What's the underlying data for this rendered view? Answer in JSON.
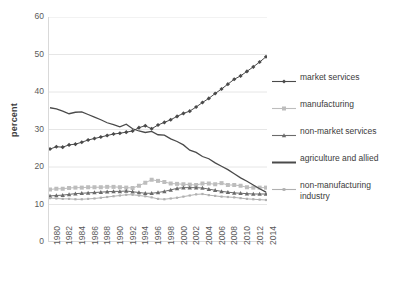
{
  "chart_data": {
    "type": "line",
    "title": "",
    "xlabel": "",
    "ylabel": "percent",
    "ylim": [
      0,
      60
    ],
    "yticks": [
      0,
      10,
      20,
      30,
      40,
      50,
      60
    ],
    "grid": true,
    "legend_position": "right",
    "x": [
      1980,
      1981,
      1982,
      1983,
      1984,
      1985,
      1986,
      1987,
      1988,
      1989,
      1990,
      1991,
      1992,
      1993,
      1994,
      1995,
      1996,
      1997,
      1998,
      1999,
      2000,
      2001,
      2002,
      2003,
      2004,
      2005,
      2006,
      2007,
      2008,
      2009,
      2010,
      2011,
      2012,
      2013,
      2014
    ],
    "xtick_labels": [
      "1980",
      "1982",
      "1984",
      "1986",
      "1988",
      "1990",
      "1992",
      "1994",
      "1996",
      "1998",
      "2000",
      "2002",
      "2004",
      "2006",
      "2008",
      "2010",
      "2012",
      "2014"
    ],
    "series": [
      {
        "name": "market services",
        "marker": "diamond",
        "color": "#4a4a4a",
        "values": [
          24.8,
          25.4,
          25.3,
          25.9,
          26.1,
          26.6,
          27.2,
          27.6,
          28.0,
          28.4,
          28.8,
          29.0,
          29.3,
          29.6,
          30.5,
          31.0,
          30.2,
          31.2,
          31.9,
          32.6,
          33.5,
          34.3,
          34.9,
          36.0,
          37.2,
          38.3,
          39.6,
          40.8,
          42.1,
          43.4,
          44.3,
          45.5,
          46.7,
          48.0,
          49.4
        ]
      },
      {
        "name": "manufacturing",
        "marker": "square",
        "color": "#bdbdbd",
        "values": [
          14.0,
          14.2,
          14.2,
          14.4,
          14.5,
          14.5,
          14.6,
          14.6,
          14.6,
          14.7,
          14.7,
          14.6,
          14.5,
          14.4,
          15.0,
          15.8,
          16.6,
          16.3,
          16.0,
          15.6,
          15.5,
          15.4,
          15.3,
          15.2,
          15.6,
          15.6,
          15.4,
          15.7,
          15.2,
          15.2,
          15.0,
          14.6,
          14.5,
          14.5,
          14.5
        ]
      },
      {
        "name": "non-market services",
        "marker": "triangle",
        "color": "#6b6b6b",
        "values": [
          12.3,
          12.4,
          12.5,
          12.7,
          12.9,
          13.0,
          13.1,
          13.2,
          13.3,
          13.4,
          13.5,
          13.5,
          13.6,
          13.4,
          13.2,
          13.0,
          13.0,
          13.2,
          13.5,
          13.9,
          14.3,
          14.5,
          14.5,
          14.5,
          14.4,
          14.1,
          13.8,
          13.5,
          13.3,
          13.1,
          13.0,
          12.9,
          12.8,
          12.8,
          12.8
        ]
      },
      {
        "name": "agriculture and allied",
        "marker": "none",
        "color": "#4a4a4a",
        "values": [
          35.8,
          35.5,
          34.9,
          34.2,
          34.6,
          34.7,
          34.0,
          33.3,
          32.6,
          31.8,
          31.3,
          30.7,
          31.4,
          30.2,
          29.6,
          29.2,
          29.5,
          28.6,
          28.5,
          27.5,
          26.8,
          25.9,
          24.5,
          23.9,
          22.8,
          22.2,
          21.1,
          20.2,
          19.3,
          18.2,
          17.1,
          16.2,
          15.2,
          14.2,
          13.3
        ]
      },
      {
        "name": "non-manufacturing industry",
        "marker": "dot",
        "color": "#b0b0b0",
        "values": [
          11.7,
          11.6,
          11.5,
          11.5,
          11.4,
          11.4,
          11.5,
          11.6,
          11.8,
          12.0,
          12.2,
          12.4,
          12.6,
          12.6,
          12.4,
          12.2,
          11.9,
          11.5,
          11.4,
          11.6,
          11.8,
          12.1,
          12.4,
          12.7,
          12.8,
          12.5,
          12.3,
          12.1,
          12.0,
          11.9,
          11.7,
          11.5,
          11.4,
          11.3,
          11.2
        ]
      }
    ]
  },
  "legend": {
    "items": [
      {
        "label": "market services"
      },
      {
        "label": "manufacturing"
      },
      {
        "label": "non-market services"
      },
      {
        "label": "agriculture and allied"
      },
      {
        "label": "non-manufacturing industry"
      }
    ]
  }
}
